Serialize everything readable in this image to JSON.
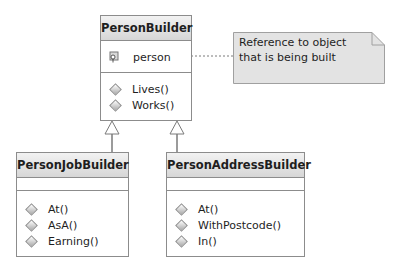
{
  "classes": {
    "person_builder": {
      "name": "PersonBuilder",
      "fields": [
        {
          "name": "person",
          "icon": "field-icon"
        }
      ],
      "methods": [
        {
          "name": "Lives()",
          "icon": "method-icon"
        },
        {
          "name": "Works()",
          "icon": "method-icon"
        }
      ]
    },
    "person_job_builder": {
      "name": "PersonJobBuilder",
      "fields": [],
      "methods": [
        {
          "name": "At()",
          "icon": "method-icon"
        },
        {
          "name": "AsA()",
          "icon": "method-icon"
        },
        {
          "name": "Earning()",
          "icon": "method-icon"
        }
      ]
    },
    "person_address_builder": {
      "name": "PersonAddressBuilder",
      "fields": [],
      "methods": [
        {
          "name": "At()",
          "icon": "method-icon"
        },
        {
          "name": "WithPostcode()",
          "icon": "method-icon"
        },
        {
          "name": "In()",
          "icon": "method-icon"
        }
      ]
    }
  },
  "note": {
    "line1": "Reference to object",
    "line2": "that is being built"
  },
  "relationships": [
    {
      "type": "inheritance",
      "from": "PersonJobBuilder",
      "to": "PersonBuilder"
    },
    {
      "type": "inheritance",
      "from": "PersonAddressBuilder",
      "to": "PersonBuilder"
    },
    {
      "type": "note-link",
      "from": "person",
      "to": "note"
    }
  ]
}
